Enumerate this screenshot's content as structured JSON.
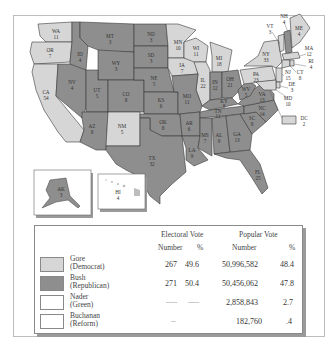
{
  "colors": {
    "democrat": "#d6d6d6",
    "republican": "#8e8e8e",
    "green": "#ffffff",
    "reform": "#ffffff",
    "border": "#3a3a3a",
    "water": "#ffffff"
  },
  "map": {
    "states": [
      {
        "abbr": "WA",
        "ev": "11",
        "party": "D"
      },
      {
        "abbr": "OR",
        "ev": "7",
        "party": "D"
      },
      {
        "abbr": "CA",
        "ev": "54",
        "party": "D"
      },
      {
        "abbr": "NV",
        "ev": "4",
        "party": "R"
      },
      {
        "abbr": "ID",
        "ev": "4",
        "party": "R"
      },
      {
        "abbr": "MT",
        "ev": "3",
        "party": "R"
      },
      {
        "abbr": "WY",
        "ev": "3",
        "party": "R"
      },
      {
        "abbr": "UT",
        "ev": "5",
        "party": "R"
      },
      {
        "abbr": "AZ",
        "ev": "8",
        "party": "R"
      },
      {
        "abbr": "CO",
        "ev": "8",
        "party": "R"
      },
      {
        "abbr": "NM",
        "ev": "5",
        "party": "D"
      },
      {
        "abbr": "ND",
        "ev": "3",
        "party": "R"
      },
      {
        "abbr": "SD",
        "ev": "3",
        "party": "R"
      },
      {
        "abbr": "NE",
        "ev": "5",
        "party": "R"
      },
      {
        "abbr": "KS",
        "ev": "6",
        "party": "R"
      },
      {
        "abbr": "OK",
        "ev": "8",
        "party": "R"
      },
      {
        "abbr": "TX",
        "ev": "32",
        "party": "R"
      },
      {
        "abbr": "MN",
        "ev": "10",
        "party": "D"
      },
      {
        "abbr": "IA",
        "ev": "7",
        "party": "D"
      },
      {
        "abbr": "MO",
        "ev": "11",
        "party": "R"
      },
      {
        "abbr": "AR",
        "ev": "6",
        "party": "R"
      },
      {
        "abbr": "LA",
        "ev": "9",
        "party": "R"
      },
      {
        "abbr": "WI",
        "ev": "11",
        "party": "D"
      },
      {
        "abbr": "IL",
        "ev": "22",
        "party": "D"
      },
      {
        "abbr": "MI",
        "ev": "18",
        "party": "D"
      },
      {
        "abbr": "IN",
        "ev": "12",
        "party": "R"
      },
      {
        "abbr": "OH",
        "ev": "21",
        "party": "R"
      },
      {
        "abbr": "KY",
        "ev": "8",
        "party": "R"
      },
      {
        "abbr": "TN",
        "ev": "11",
        "party": "R"
      },
      {
        "abbr": "MS",
        "ev": "7",
        "party": "R"
      },
      {
        "abbr": "AL",
        "ev": "9",
        "party": "R"
      },
      {
        "abbr": "GA",
        "ev": "13",
        "party": "R"
      },
      {
        "abbr": "FL",
        "ev": "25",
        "party": "R"
      },
      {
        "abbr": "SC",
        "ev": "8",
        "party": "R"
      },
      {
        "abbr": "NC",
        "ev": "14",
        "party": "R"
      },
      {
        "abbr": "VA",
        "ev": "13",
        "party": "R"
      },
      {
        "abbr": "WV",
        "ev": "5",
        "party": "R"
      },
      {
        "abbr": "PA",
        "ev": "23",
        "party": "D"
      },
      {
        "abbr": "NY",
        "ev": "33",
        "party": "D"
      },
      {
        "abbr": "VT",
        "ev": "3",
        "party": "D"
      },
      {
        "abbr": "NH",
        "ev": "4",
        "party": "R"
      },
      {
        "abbr": "ME",
        "ev": "4",
        "party": "D"
      },
      {
        "abbr": "MA",
        "ev": "12",
        "party": "D"
      },
      {
        "abbr": "RI",
        "ev": "4",
        "party": "D"
      },
      {
        "abbr": "CT",
        "ev": "8",
        "party": "D"
      },
      {
        "abbr": "NJ",
        "ev": "15",
        "party": "D"
      },
      {
        "abbr": "DE",
        "ev": "3",
        "party": "D"
      },
      {
        "abbr": "MD",
        "ev": "10",
        "party": "D"
      },
      {
        "abbr": "DC",
        "ev": "2",
        "party": "D"
      },
      {
        "abbr": "AK",
        "ev": "3",
        "party": "R"
      },
      {
        "abbr": "HI",
        "ev": "4",
        "party": "D"
      }
    ]
  },
  "legend": {
    "headers": {
      "electoral": "Electoral Vote",
      "popular": "Popular Vote",
      "number": "Number",
      "percent": "%"
    },
    "rows": [
      {
        "name": "Gore",
        "party": "(Democrat)",
        "ev_num": "267",
        "ev_pct": "49.6",
        "pop_num": "50,996,582",
        "pop_pct": "48.4"
      },
      {
        "name": "Bush",
        "party": "(Republican)",
        "ev_num": "271",
        "ev_pct": "50.4",
        "pop_num": "50,456,062",
        "pop_pct": "47.8"
      },
      {
        "name": "Nader",
        "party": "(Green)",
        "ev_num": "-----",
        "ev_pct": "-----",
        "pop_num": "2,858,843",
        "pop_pct": "2.7"
      },
      {
        "name": "Buchanan",
        "party": "(Reform)",
        "ev_num": "--",
        "ev_pct": "",
        "pop_num": "182,760",
        "pop_pct": ".4"
      }
    ]
  }
}
